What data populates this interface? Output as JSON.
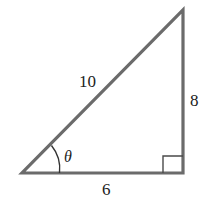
{
  "diagram": {
    "type": "right-triangle",
    "colors": {
      "stroke": "#6b6b6b",
      "text": "#222222",
      "background": "#ffffff"
    },
    "vertices": {
      "bottom_left": [
        22,
        173
      ],
      "bottom_right": [
        183,
        173
      ],
      "top": [
        183,
        10
      ]
    },
    "labels": {
      "hypotenuse": "10",
      "vertical_side": "8",
      "base": "6",
      "angle": "θ"
    },
    "right_angle_marker": true
  }
}
